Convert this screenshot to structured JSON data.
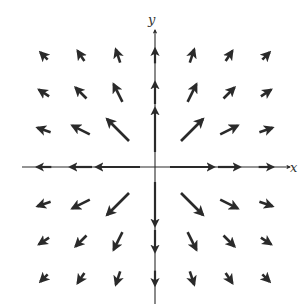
{
  "diagram": {
    "type": "vector-field",
    "axes": {
      "x_label": "x",
      "y_label": "y",
      "origin_px": [
        155,
        167
      ],
      "grid_spacing_px": 37
    },
    "colors": {
      "ink": "#2a2a2a",
      "background": "#ffffff"
    },
    "grid_points": [
      -3,
      -2,
      -1,
      1,
      2,
      3
    ],
    "axis_arrow_offsets": [
      1,
      2,
      3
    ],
    "arrow_scale": 44
  }
}
